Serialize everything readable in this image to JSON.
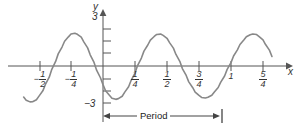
{
  "chart_data": {
    "type": "line",
    "title": "",
    "xlabel": "x",
    "ylabel": "y",
    "xlim": [
      -0.65,
      1.45
    ],
    "ylim": [
      -3.9,
      3.9
    ],
    "grid": false,
    "legend": null,
    "function": "y = 3 cos(4πx)",
    "amplitude": 3,
    "period": 0.5,
    "x_ticks": [
      {
        "value": -0.5,
        "label": "−1/2",
        "sign": "−",
        "numerator": "1",
        "denominator": "2"
      },
      {
        "value": -0.25,
        "label": "−1/4",
        "sign": "−",
        "numerator": "1",
        "denominator": "4"
      },
      {
        "value": 0.25,
        "label": "1/4",
        "sign": "",
        "numerator": "1",
        "denominator": "4"
      },
      {
        "value": 0.5,
        "label": "1/2",
        "sign": "",
        "numerator": "1",
        "denominator": "2"
      },
      {
        "value": 0.75,
        "label": "3/4",
        "sign": "",
        "numerator": "3",
        "denominator": "4"
      },
      {
        "value": 1.0,
        "label": "1",
        "sign": "",
        "numerator": "",
        "denominator": ""
      },
      {
        "value": 1.25,
        "label": "5/4",
        "sign": "",
        "numerator": "5",
        "denominator": "4"
      }
    ],
    "y_ticks": [
      {
        "value": 3,
        "label": "3"
      },
      {
        "value": 2,
        "label": ""
      },
      {
        "value": 1,
        "label": ""
      },
      {
        "value": -1,
        "label": ""
      },
      {
        "value": -2,
        "label": ""
      },
      {
        "value": -3,
        "label": "−3"
      }
    ],
    "annotations": [
      {
        "name": "period-bracket",
        "text": "Period",
        "from_x": 0.0,
        "to_x": 1.0,
        "y": -3.7
      }
    ],
    "series": [
      {
        "name": "cosine-curve",
        "color": "#888888",
        "x": [
          -0.62,
          -0.6,
          -0.57,
          -0.55,
          -0.52,
          -0.5,
          -0.47,
          -0.45,
          -0.42,
          -0.4,
          -0.37,
          -0.35,
          -0.32,
          -0.3,
          -0.27,
          -0.25,
          -0.22,
          -0.2,
          -0.17,
          -0.15,
          -0.12,
          -0.1,
          -0.07,
          -0.05,
          -0.02,
          0.0,
          0.02,
          0.05,
          0.07,
          0.1,
          0.12,
          0.15,
          0.17,
          0.2,
          0.22,
          0.25,
          0.27,
          0.3,
          0.32,
          0.35,
          0.37,
          0.4,
          0.42,
          0.45,
          0.47,
          0.5,
          0.52,
          0.55,
          0.57,
          0.6,
          0.62,
          0.65,
          0.67,
          0.7,
          0.72,
          0.75,
          0.77,
          0.8,
          0.82,
          0.85,
          0.87,
          0.9,
          0.92,
          0.95,
          0.97,
          1.0,
          1.02,
          1.05,
          1.07,
          1.1,
          1.12,
          1.15,
          1.17,
          1.2,
          1.22,
          1.25,
          1.27,
          1.3,
          1.32
        ],
        "y": [
          -2.59,
          -2.85,
          -2.99,
          -2.98,
          -2.81,
          -2.51,
          -2.07,
          -1.54,
          -0.93,
          -0.28,
          0.38,
          1.01,
          1.58,
          2.06,
          2.43,
          2.66,
          2.73,
          2.64,
          2.4,
          2.01,
          1.51,
          0.93,
          0.3,
          -0.35,
          -0.98,
          -1.55,
          -2.06,
          -2.43,
          -2.68,
          -2.78,
          -2.72,
          -2.52,
          -2.18,
          -1.73,
          -1.19,
          -0.59,
          0.04,
          0.66,
          1.24,
          1.75,
          2.16,
          2.46,
          2.63,
          2.66,
          2.55,
          2.31,
          1.95,
          1.49,
          0.96,
          0.39,
          -0.21,
          -0.79,
          -1.32,
          -1.79,
          -2.17,
          -2.45,
          -2.62,
          -2.67,
          -2.61,
          -2.44,
          -2.16,
          -1.79,
          -1.34,
          -0.83,
          -0.28,
          0.28,
          0.83,
          1.34,
          1.79,
          2.16,
          2.44,
          2.61,
          2.67,
          2.62,
          2.45,
          2.17,
          1.79,
          1.32,
          0.79
        ]
      }
    ]
  },
  "axes": {
    "x_axis_name": "x",
    "y_axis_name": "y",
    "y_top_label": "3",
    "y_bottom_label": "−3"
  },
  "period_annotation": {
    "text": "Period"
  },
  "colors": {
    "curve": "#888888",
    "axis": "#555555",
    "text": "#333333"
  }
}
